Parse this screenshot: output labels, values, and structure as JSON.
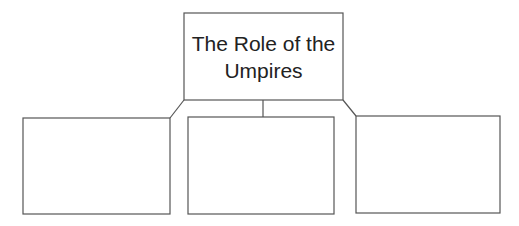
{
  "diagram": {
    "type": "hierarchy",
    "root": {
      "label_line1": "The Role of the",
      "label_line2": "Umpires"
    },
    "children": [
      {
        "label": ""
      },
      {
        "label": ""
      },
      {
        "label": ""
      }
    ]
  }
}
